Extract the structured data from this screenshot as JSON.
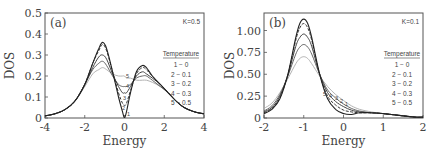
{
  "chart_data": [
    {
      "type": "line",
      "panel_label": "(a)",
      "annotation": "K=0.5",
      "xlabel": "Energy",
      "ylabel": "DOS",
      "xlim": [
        -4,
        4
      ],
      "ylim": [
        0,
        0.5
      ],
      "xticks": [
        "-4",
        "-2",
        "0",
        "2",
        "4"
      ],
      "yticks": [
        "0",
        "0.1",
        "0.2",
        "0.3",
        "0.4",
        "0.5"
      ],
      "grid": false,
      "legend": {
        "title": "Temperature",
        "position": "right",
        "entries": [
          "1 − 0",
          "2 − 0.1",
          "3 − 0.2",
          "4 − 0.3",
          "5 − 0.5"
        ]
      },
      "x": [
        -4,
        -3.5,
        -3,
        -2.5,
        -2,
        -1.6,
        -1.3,
        -1.1,
        -0.9,
        -0.6,
        -0.3,
        -0.1,
        0,
        0.1,
        0.3,
        0.6,
        0.9,
        1.1,
        1.4,
        1.8,
        2.2,
        2.6,
        3,
        3.5,
        4
      ],
      "series": [
        {
          "name": "1 - 0",
          "values": [
            0.01,
            0.02,
            0.04,
            0.08,
            0.16,
            0.26,
            0.33,
            0.36,
            0.33,
            0.22,
            0.1,
            0.03,
            0.0,
            0.03,
            0.12,
            0.22,
            0.25,
            0.24,
            0.2,
            0.16,
            0.12,
            0.08,
            0.05,
            0.03,
            0.02
          ]
        },
        {
          "name": "2 - 0.1",
          "values": [
            0.01,
            0.02,
            0.04,
            0.08,
            0.16,
            0.26,
            0.32,
            0.35,
            0.32,
            0.22,
            0.12,
            0.07,
            0.06,
            0.07,
            0.13,
            0.21,
            0.24,
            0.23,
            0.2,
            0.16,
            0.12,
            0.08,
            0.05,
            0.03,
            0.02
          ]
        },
        {
          "name": "3 - 0.2",
          "values": [
            0.01,
            0.02,
            0.04,
            0.08,
            0.16,
            0.24,
            0.29,
            0.3,
            0.28,
            0.21,
            0.15,
            0.12,
            0.12,
            0.12,
            0.15,
            0.2,
            0.22,
            0.21,
            0.19,
            0.16,
            0.12,
            0.08,
            0.05,
            0.03,
            0.02
          ]
        },
        {
          "name": "4 - 0.3",
          "values": [
            0.01,
            0.02,
            0.04,
            0.08,
            0.16,
            0.23,
            0.26,
            0.27,
            0.25,
            0.2,
            0.16,
            0.15,
            0.15,
            0.15,
            0.16,
            0.19,
            0.2,
            0.2,
            0.18,
            0.15,
            0.12,
            0.08,
            0.05,
            0.03,
            0.02
          ]
        },
        {
          "name": "5 - 0.5",
          "values": [
            0.01,
            0.02,
            0.04,
            0.08,
            0.15,
            0.21,
            0.23,
            0.24,
            0.23,
            0.21,
            0.2,
            0.2,
            0.2,
            0.19,
            0.19,
            0.18,
            0.18,
            0.18,
            0.17,
            0.15,
            0.12,
            0.08,
            0.05,
            0.03,
            0.02
          ]
        }
      ],
      "curve_labels": [
        "5",
        "4",
        "3",
        "2",
        "1"
      ]
    },
    {
      "type": "line",
      "panel_label": "(b)",
      "annotation": "K=0.1",
      "xlabel": "Energy",
      "ylabel": "DOS",
      "xlim": [
        -2,
        2
      ],
      "ylim": [
        0,
        1.2
      ],
      "xticks": [
        "-2",
        "-1",
        "0",
        "1",
        "2"
      ],
      "yticks": [
        "0",
        "0.25",
        "0.50",
        "0.75",
        "1.00"
      ],
      "grid": false,
      "legend": {
        "title": "Temperature",
        "position": "right",
        "entries": [
          "1 − 0",
          "2 − 0.1",
          "3 − 0.2",
          "4 − 0.3",
          "5 − 0.5"
        ]
      },
      "x": [
        -2,
        -1.8,
        -1.6,
        -1.4,
        -1.2,
        -1.1,
        -1.0,
        -0.9,
        -0.8,
        -0.6,
        -0.4,
        -0.2,
        0,
        0.2,
        0.4,
        0.7,
        1.0,
        1.4,
        1.8,
        2
      ],
      "series": [
        {
          "name": "1 - 0",
          "values": [
            0.05,
            0.1,
            0.22,
            0.5,
            0.92,
            1.08,
            1.13,
            1.08,
            0.92,
            0.5,
            0.22,
            0.1,
            0.05,
            0.04,
            0.06,
            0.06,
            0.05,
            0.03,
            0.01,
            0.01
          ]
        },
        {
          "name": "2 - 0.1",
          "values": [
            0.06,
            0.11,
            0.23,
            0.5,
            0.89,
            1.03,
            1.08,
            1.03,
            0.89,
            0.5,
            0.25,
            0.15,
            0.09,
            0.07,
            0.06,
            0.06,
            0.05,
            0.03,
            0.01,
            0.01
          ]
        },
        {
          "name": "3 - 0.2",
          "values": [
            0.07,
            0.12,
            0.25,
            0.49,
            0.82,
            0.92,
            0.96,
            0.92,
            0.82,
            0.5,
            0.29,
            0.19,
            0.13,
            0.09,
            0.07,
            0.06,
            0.05,
            0.03,
            0.01,
            0.01
          ]
        },
        {
          "name": "4 - 0.3",
          "values": [
            0.08,
            0.14,
            0.27,
            0.48,
            0.73,
            0.81,
            0.84,
            0.81,
            0.73,
            0.5,
            0.32,
            0.23,
            0.16,
            0.11,
            0.08,
            0.06,
            0.05,
            0.03,
            0.01,
            0.01
          ]
        },
        {
          "name": "5 - 0.5",
          "values": [
            0.11,
            0.17,
            0.29,
            0.45,
            0.62,
            0.68,
            0.7,
            0.68,
            0.62,
            0.48,
            0.36,
            0.27,
            0.2,
            0.14,
            0.1,
            0.07,
            0.05,
            0.03,
            0.01,
            0.01
          ]
        }
      ],
      "curve_labels": [
        "5",
        "4",
        "3",
        "2",
        "1"
      ]
    }
  ]
}
